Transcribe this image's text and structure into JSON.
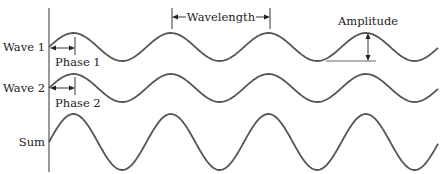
{
  "diagram": {
    "type": "wave-superposition",
    "colors": {
      "curve": "#555555",
      "text": "#222222",
      "axis": "#777777"
    },
    "rows": [
      {
        "label": "Wave 1",
        "center_y": 47,
        "amplitude": 14
      },
      {
        "label": "Wave 2",
        "center_y": 88,
        "amplitude": 14
      },
      {
        "label": "Sum",
        "center_y": 142,
        "amplitude": 28
      }
    ],
    "annotations": {
      "wavelength": "Wavelength",
      "amplitude": "Amplitude",
      "phase1": "Phase 1",
      "phase2": "Phase 2"
    }
  }
}
